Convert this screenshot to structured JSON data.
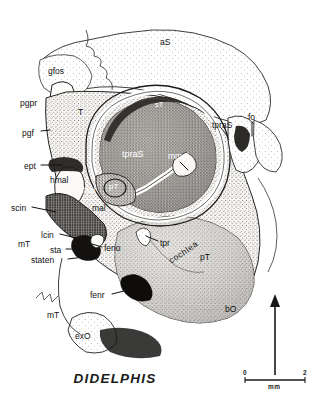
{
  "figure": {
    "caption": "DIDELPHIS",
    "style": "stippled ink drawing"
  },
  "labels": [
    {
      "id": "aS",
      "text": "aS",
      "x": 160,
      "y": 38,
      "size": 8.5,
      "color": "dark"
    },
    {
      "id": "gfos",
      "text": "gfos",
      "x": 48,
      "y": 67,
      "size": 8.5,
      "color": "dark"
    },
    {
      "id": "pgpr",
      "text": "pgpr",
      "x": 20,
      "y": 99,
      "size": 8.5,
      "color": "dark"
    },
    {
      "id": "T",
      "text": "T",
      "x": 78,
      "y": 108,
      "size": 8.5,
      "color": "dark"
    },
    {
      "id": "pgf",
      "text": "pgf",
      "x": 22,
      "y": 129,
      "size": 8.5,
      "color": "dark"
    },
    {
      "id": "sT",
      "text": "sT",
      "x": 155,
      "y": 101,
      "size": 7.5,
      "color": "white"
    },
    {
      "id": "tpraS2",
      "text": "tpraS",
      "x": 212,
      "y": 121,
      "size": 8.5,
      "color": "dark"
    },
    {
      "id": "fo",
      "text": "fo",
      "x": 248,
      "y": 113,
      "size": 8.5,
      "color": "dark"
    },
    {
      "id": "tpraS1",
      "text": "tpraS",
      "x": 122,
      "y": 150,
      "size": 9,
      "color": "white"
    },
    {
      "id": "mmal",
      "text": "mmal",
      "x": 168,
      "y": 152,
      "size": 8.5,
      "color": "white"
    },
    {
      "id": "ept",
      "text": "ept",
      "x": 24,
      "y": 162,
      "size": 8.5,
      "color": "dark"
    },
    {
      "id": "hmal",
      "text": "hmal",
      "x": 50,
      "y": 176,
      "size": 8.5,
      "color": "dark"
    },
    {
      "id": "lmal",
      "text": "lmal",
      "x": 80,
      "y": 186,
      "size": 8.5,
      "color": "white"
    },
    {
      "id": "pT",
      "text": "pT",
      "x": 109,
      "y": 183,
      "size": 8,
      "color": "white"
    },
    {
      "id": "mal",
      "text": "mal",
      "x": 92,
      "y": 204,
      "size": 8.5,
      "color": "dark"
    },
    {
      "id": "scin",
      "text": "scin",
      "x": 11,
      "y": 204,
      "size": 8.5,
      "color": "dark"
    },
    {
      "id": "lcin",
      "text": "lcin",
      "x": 41,
      "y": 231,
      "size": 8.5,
      "color": "dark"
    },
    {
      "id": "mT1",
      "text": "mT",
      "x": 18,
      "y": 240,
      "size": 8.5,
      "color": "dark"
    },
    {
      "id": "sta",
      "text": "sta",
      "x": 50,
      "y": 246,
      "size": 8.5,
      "color": "dark"
    },
    {
      "id": "feno",
      "text": "feno",
      "x": 104,
      "y": 244,
      "size": 8.5,
      "color": "dark"
    },
    {
      "id": "staten",
      "text": "staten",
      "x": 31,
      "y": 256,
      "size": 8.5,
      "color": "dark"
    },
    {
      "id": "tpr",
      "text": "tpr",
      "x": 160,
      "y": 239,
      "size": 8.5,
      "color": "dark"
    },
    {
      "id": "pT2",
      "text": "pT",
      "x": 200,
      "y": 253,
      "size": 8.5,
      "color": "dark"
    },
    {
      "id": "fenr",
      "text": "fenr",
      "x": 90,
      "y": 291,
      "size": 8.5,
      "color": "dark"
    },
    {
      "id": "bO",
      "text": "bO",
      "x": 225,
      "y": 305,
      "size": 8.5,
      "color": "dark"
    },
    {
      "id": "mT2",
      "text": "mT",
      "x": 47,
      "y": 311,
      "size": 8.5,
      "color": "dark"
    },
    {
      "id": "exO",
      "text": "exO",
      "x": 75,
      "y": 332,
      "size": 8.5,
      "color": "dark"
    }
  ],
  "curved_label": {
    "id": "cochlea",
    "text": "cochlea"
  },
  "scale_bar": {
    "min": "0",
    "max": "2",
    "unit": "mm"
  },
  "orientation_arrow": {
    "direction": "up"
  },
  "colors": {
    "ink": "#1a1a1a",
    "paper": "#ffffff",
    "bone_light": "#f2f0ec",
    "bone_mid": "#bdb9b2",
    "bone_dark": "#7d7a74",
    "cavity": "#8a8680"
  }
}
